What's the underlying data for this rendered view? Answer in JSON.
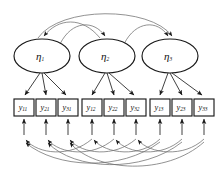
{
  "diagram": {
    "type": "sem-path-diagram",
    "background_color": "#ffffff",
    "line_color": "#2b2b2b",
    "curve_color": "#6e6e6e",
    "node_fill": "#ffffff",
    "latents": [
      {
        "id": "eta1",
        "label": "η",
        "subscript": "1",
        "cx": 42,
        "cy": 56,
        "rx": 28,
        "ry": 17
      },
      {
        "id": "eta2",
        "label": "η",
        "subscript": "2",
        "cx": 107,
        "cy": 56,
        "rx": 28,
        "ry": 17
      },
      {
        "id": "eta3",
        "label": "η",
        "subscript": "3",
        "cx": 170,
        "cy": 56,
        "rx": 28,
        "ry": 17
      }
    ],
    "observed": [
      {
        "id": "y11",
        "label": "y",
        "subscript": "11",
        "x": 14,
        "y": 99,
        "w": 20,
        "h": 17
      },
      {
        "id": "y21",
        "label": "y",
        "subscript": "21",
        "x": 36,
        "y": 99,
        "w": 20,
        "h": 17
      },
      {
        "id": "y31",
        "label": "y",
        "subscript": "31",
        "x": 58,
        "y": 99,
        "w": 20,
        "h": 17
      },
      {
        "id": "y12",
        "label": "y",
        "subscript": "12",
        "x": 82,
        "y": 99,
        "w": 20,
        "h": 17
      },
      {
        "id": "y22",
        "label": "y",
        "subscript": "22",
        "x": 104,
        "y": 99,
        "w": 20,
        "h": 17
      },
      {
        "id": "y32",
        "label": "y",
        "subscript": "32",
        "x": 126,
        "y": 99,
        "w": 20,
        "h": 17
      },
      {
        "id": "y13",
        "label": "y",
        "subscript": "13",
        "x": 150,
        "y": 99,
        "w": 20,
        "h": 17
      },
      {
        "id": "y23",
        "label": "y",
        "subscript": "23",
        "x": 172,
        "y": 99,
        "w": 20,
        "h": 17
      },
      {
        "id": "y33",
        "label": "y",
        "subscript": "33",
        "x": 194,
        "y": 99,
        "w": 20,
        "h": 17
      }
    ],
    "structural_paths": [
      {
        "from": "eta1",
        "to": "eta2",
        "style": "curved-arc-top"
      },
      {
        "from": "eta2",
        "to": "eta3",
        "style": "curved-arc-top"
      },
      {
        "from": "eta1",
        "to": "eta3",
        "style": "curved-arc-top-long"
      }
    ],
    "loadings": [
      {
        "from": "eta1",
        "to": "y11"
      },
      {
        "from": "eta1",
        "to": "y21"
      },
      {
        "from": "eta1",
        "to": "y31"
      },
      {
        "from": "eta2",
        "to": "y12"
      },
      {
        "from": "eta2",
        "to": "y22"
      },
      {
        "from": "eta2",
        "to": "y32"
      },
      {
        "from": "eta3",
        "to": "y13"
      },
      {
        "from": "eta3",
        "to": "y23"
      },
      {
        "from": "eta3",
        "to": "y33"
      }
    ],
    "residuals": [
      {
        "to": "y11"
      },
      {
        "to": "y21"
      },
      {
        "to": "y31"
      },
      {
        "to": "y12"
      },
      {
        "to": "y22"
      },
      {
        "to": "y32"
      },
      {
        "to": "y13"
      },
      {
        "to": "y23"
      },
      {
        "to": "y33"
      }
    ],
    "correlated_residual_arcs": [
      {
        "from": "y12",
        "to": "y11",
        "style": "curved-arc-bottom"
      },
      {
        "from": "y22",
        "to": "y21",
        "style": "curved-arc-bottom"
      },
      {
        "from": "y32",
        "to": "y31",
        "style": "curved-arc-bottom"
      },
      {
        "from": "y13",
        "to": "y12",
        "style": "curved-arc-bottom"
      },
      {
        "from": "y23",
        "to": "y22",
        "style": "curved-arc-bottom"
      },
      {
        "from": "y33",
        "to": "y32",
        "style": "curved-arc-bottom"
      },
      {
        "from": "y13",
        "to": "y11",
        "style": "curved-arc-bottom-long"
      },
      {
        "from": "y23",
        "to": "y21",
        "style": "curved-arc-bottom-long"
      },
      {
        "from": "y33",
        "to": "y31",
        "style": "curved-arc-bottom-long"
      }
    ]
  }
}
